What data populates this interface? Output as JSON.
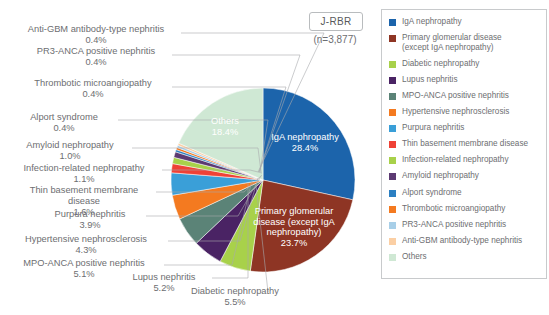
{
  "header": {
    "title_box": "J-RBR",
    "sample_size": "(n=3,877)"
  },
  "chart_data": {
    "type": "pie",
    "title": "J-RBR",
    "subtitle": "(n=3,877)",
    "unit": "%",
    "legend_position": "right",
    "start_angle_deg": -90,
    "direction": "clockwise",
    "center": [
      263,
      180
    ],
    "radius": 92,
    "categories": [
      "IgA nephropathy",
      "Primary glomerular disease (except IgA nephropathy)",
      "Diabetic nephropathy",
      "Lupus nephritis",
      "MPO-ANCA positive nephritis",
      "Hypertensive nephrosclerosis",
      "Purpura nephritis",
      "Thin basement membrane disease",
      "Infection-related nephropathy",
      "Amyloid nephropathy",
      "Alport syndrome",
      "Thrombotic microangiopathy",
      "PR3-ANCA positive nephritis",
      "Anti-GBM antibody-type nephritis",
      "Others"
    ],
    "values": [
      28.4,
      23.7,
      5.5,
      5.2,
      5.1,
      4.3,
      3.9,
      1.6,
      1.1,
      1.0,
      0.4,
      0.4,
      0.4,
      0.4,
      18.4
    ],
    "colors": [
      "#1c64ab",
      "#8e3524",
      "#a8d14a",
      "#4a2364",
      "#5b8377",
      "#f47a20",
      "#3a9fd8",
      "#ef4136",
      "#a8d14a",
      "#5c3a72",
      "#2b7fc2",
      "#f47a20",
      "#a8cfe8",
      "#fbcfa4",
      "#cfe8d4"
    ]
  },
  "pie_labels": [
    {
      "name": "iga-nephropathy",
      "text": "IgA nephropathy\n28.4%",
      "x": 305,
      "y": 140,
      "tone": "light"
    },
    {
      "name": "primary-glomerular-disease",
      "text": "Primary glomerular\ndisease (except IgA\nnephropathy)\n23.7%",
      "x": 294,
      "y": 214,
      "tone": "light"
    },
    {
      "name": "others",
      "text": "Others\n18.4%",
      "x": 225,
      "y": 124,
      "tone": "light"
    }
  ],
  "callouts": [
    {
      "name": "anti-gbm-antibody-type-nephritis",
      "text": "Anti-GBM antibody-type nephritis\n0.4%",
      "left": 12,
      "top": 24,
      "width": 168
    },
    {
      "name": "pr3-anca-positive-nephritis",
      "text": "PR3-ANCA positive nephritis\n0.4%",
      "left": 24,
      "top": 46,
      "width": 144
    },
    {
      "name": "thrombotic-microangiopathy",
      "text": "Thrombotic microangiopathy\n0.4%",
      "left": 18,
      "top": 78,
      "width": 150
    },
    {
      "name": "alport-syndrome",
      "text": "Alport syndrome\n0.4%",
      "left": 14,
      "top": 112,
      "width": 100
    },
    {
      "name": "amyloid-nephropathy",
      "text": "Amyloid nephropathy\n1.0%",
      "left": 12,
      "top": 140,
      "width": 116
    },
    {
      "name": "infection-related-nephropathy",
      "text": "Infection-related nephropathy\n1.1%",
      "left": 8,
      "top": 163,
      "width": 152
    },
    {
      "name": "thin-basement-membrane-disease",
      "text": "Thin basement membrane\ndisease\n1.6%",
      "left": 16,
      "top": 185,
      "width": 136
    },
    {
      "name": "purpura-nephritis",
      "text": "Purpura nephritis\n3.9%",
      "left": 38,
      "top": 209,
      "width": 104
    },
    {
      "name": "hypertensive-nephrosclerosis",
      "text": "Hypertensive nephrosclerosis\n4.3%",
      "left": 8,
      "top": 234,
      "width": 156
    },
    {
      "name": "mpo-anca-positive-nephritis",
      "text": "MPO-ANCA positive nephritis\n5.1%",
      "left": 8,
      "top": 258,
      "width": 152
    },
    {
      "name": "lupus-nephritis",
      "text": "Lupus nephritis\n5.2%",
      "left": 118,
      "top": 272,
      "width": 92
    },
    {
      "name": "diabetic-nephropathy",
      "text": "Diabetic nephropathy\n5.5%",
      "left": 176,
      "top": 286,
      "width": 118
    }
  ],
  "leader_lines": [
    [
      181,
      33,
      324,
      33,
      258,
      172
    ],
    [
      172,
      55,
      300,
      55,
      259,
      172
    ],
    [
      172,
      87,
      286,
      87,
      259,
      172
    ],
    [
      118,
      120,
      268,
      120,
      260,
      172
    ],
    [
      132,
      148,
      258,
      148,
      261,
      172
    ],
    [
      162,
      170,
      250,
      170,
      262,
      173
    ],
    [
      156,
      192,
      244,
      192,
      262,
      175
    ],
    [
      146,
      216,
      238,
      216,
      261,
      176
    ],
    [
      168,
      241,
      240,
      241,
      258,
      178
    ],
    [
      164,
      265,
      232,
      265,
      252,
      180
    ],
    [
      212,
      278,
      248,
      278,
      248,
      183
    ],
    [
      268,
      292,
      268,
      292,
      256,
      185
    ]
  ],
  "legend": {
    "items": [
      {
        "name": "iga-nephropathy",
        "label": "IgA nephropathy",
        "color": "#1c64ab"
      },
      {
        "name": "primary-glomerular-disease",
        "label": "Primary glomerular disease\n(except IgA nephropathy)",
        "color": "#8e3524"
      },
      {
        "name": "diabetic-nephropathy",
        "label": "Diabetic nephropathy",
        "color": "#a8d14a"
      },
      {
        "name": "lupus-nephritis",
        "label": "Lupus nephritis",
        "color": "#4a2364"
      },
      {
        "name": "mpo-anca-positive-nephritis",
        "label": "MPO-ANCA positive nephritis",
        "color": "#5b8377"
      },
      {
        "name": "hypertensive-nephrosclerosis",
        "label": "Hypertensive nephrosclerosis",
        "color": "#f47a20"
      },
      {
        "name": "purpura-nephritis",
        "label": "Purpura nephritis",
        "color": "#3a9fd8"
      },
      {
        "name": "thin-basement-membrane-disease",
        "label": "Thin basement membrane disease",
        "color": "#ef4136"
      },
      {
        "name": "infection-related-nephropathy",
        "label": "Infection-related nephropathy",
        "color": "#a8d14a"
      },
      {
        "name": "amyloid-nephropathy",
        "label": "Amyloid nephropathy",
        "color": "#5c3a72"
      },
      {
        "name": "alport-syndrome",
        "label": "Alport syndrome",
        "color": "#2b7fc2"
      },
      {
        "name": "thrombotic-microangiopathy",
        "label": "Thrombotic microangiopathy",
        "color": "#f47a20"
      },
      {
        "name": "pr3-anca-positive-nephritis",
        "label": "PR3-ANCA positive nephritis",
        "color": "#a8cfe8"
      },
      {
        "name": "anti-gbm-antibody-type-nephritis",
        "label": "Anti-GBM antibody-type nephritis",
        "color": "#fbcfa4"
      },
      {
        "name": "others",
        "label": "Others",
        "color": "#cfe8d4"
      }
    ]
  }
}
